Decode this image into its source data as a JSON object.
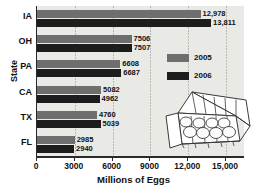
{
  "chart_data": {
    "type": "bar",
    "orientation": "horizontal",
    "title": "",
    "xlabel": "Millions of Eggs",
    "ylabel": "State",
    "categories": [
      "IA",
      "OH",
      "PA",
      "CA",
      "TX",
      "FL"
    ],
    "series": [
      {
        "name": "2005",
        "color": "#6e6e6e",
        "values": [
          12978,
          7506,
          6608,
          5082,
          4760,
          2985
        ],
        "labels": [
          "12,978",
          "7506",
          "6608",
          "5082",
          "4760",
          "2985"
        ]
      },
      {
        "name": "2006",
        "color": "#1d1d1d",
        "values": [
          13811,
          7507,
          6687,
          4962,
          5039,
          2940
        ],
        "labels": [
          "13,811",
          "7507",
          "6687",
          "4962",
          "5039",
          "2940"
        ]
      }
    ],
    "xlim": [
      0,
      16500
    ],
    "xticks": [
      0,
      3000,
      6000,
      9000,
      12000,
      15000
    ],
    "xticklabels": [
      "0",
      "3000",
      "6000",
      "9000",
      "12,000",
      "15,000"
    ],
    "grid": true,
    "legend_position": "inside-right"
  },
  "legend": {
    "items": [
      {
        "label": "2005",
        "swatch": "#6e6e6e"
      },
      {
        "label": "2006",
        "swatch": "#1d1d1d"
      }
    ]
  },
  "illustration": {
    "name": "egg-carton",
    "eggs": 12
  },
  "colors": {
    "plot_background": "#e9e9e6",
    "axis": "#2a2a2a",
    "gridline": "#b9b9b4",
    "text": "#111111",
    "page_background": "#ffffff"
  }
}
